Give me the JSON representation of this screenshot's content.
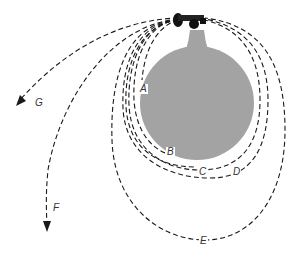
{
  "diagram": {
    "type": "newton-cannonball-orbits",
    "colors": {
      "earth": "#a3a3a3",
      "lines": "#1a1a1a",
      "background": "#ffffff"
    },
    "labels": {
      "A": "A",
      "B": "B",
      "C": "C",
      "D": "D",
      "E": "E",
      "F": "F",
      "G": "G"
    }
  }
}
